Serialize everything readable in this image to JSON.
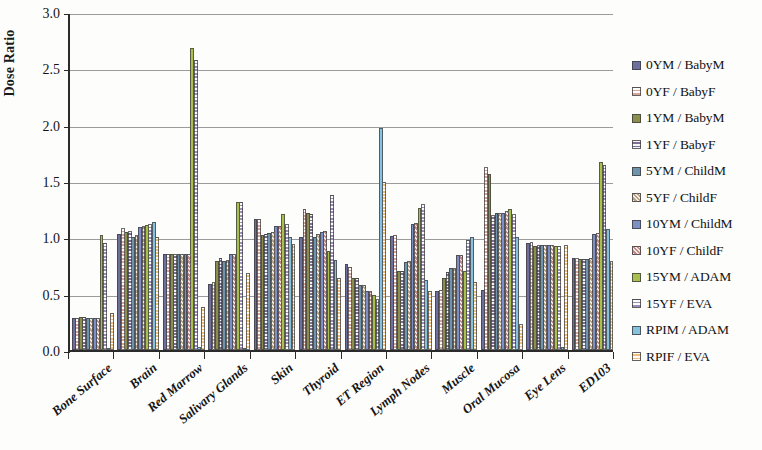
{
  "chart_data": {
    "type": "bar",
    "title": "",
    "xlabel": "",
    "ylabel": "Dose Ratio",
    "ylim": [
      0,
      3.0
    ],
    "ytick_labels": [
      "0.0",
      "0.5",
      "1.0",
      "1.5",
      "2.0",
      "2.5",
      "3.0"
    ],
    "ytick_values": [
      0,
      0.5,
      1.0,
      1.5,
      2.0,
      2.5,
      3.0
    ],
    "grid": true,
    "legend_position": "right",
    "categories": [
      "Bone Surface",
      "Brain",
      "Red Marrow",
      "Salivary Glands",
      "Skin",
      "Thyroid",
      "ET Region",
      "Lymph Nodes",
      "Muscle",
      "Oral Mucosa",
      "Eye Lens",
      "ED103"
    ],
    "series": [
      {
        "name": "0YM / BabyM",
        "color": "#6d6f9e",
        "pattern": "solid",
        "values": [
          0.28,
          1.03,
          0.85,
          0.59,
          1.16,
          1.0,
          0.76,
          1.01,
          0.52,
          0.53,
          0.95,
          0.82
        ]
      },
      {
        "name": "0YF / BabyF",
        "color": "#d7a49a",
        "pattern": "open",
        "values": [
          0.28,
          1.08,
          0.85,
          0.6,
          1.16,
          1.25,
          0.74,
          1.02,
          0.53,
          1.62,
          0.96,
          0.82
        ]
      },
      {
        "name": "1YM / BabyM",
        "color": "#8a8f4e",
        "pattern": "solid",
        "values": [
          0.29,
          1.05,
          0.85,
          0.79,
          1.02,
          1.22,
          0.64,
          0.7,
          0.64,
          1.56,
          0.92,
          0.81
        ]
      },
      {
        "name": "1YF / BabyF",
        "color": "#7c6e96",
        "pattern": "dots",
        "values": [
          0.29,
          1.06,
          0.85,
          0.82,
          1.03,
          1.21,
          0.64,
          0.7,
          0.69,
          1.2,
          0.93,
          0.81
        ]
      },
      {
        "name": "5YM / ChildM",
        "color": "#6f95ad",
        "pattern": "solid",
        "values": [
          0.28,
          1.0,
          0.85,
          0.79,
          1.04,
          1.0,
          0.58,
          0.78,
          0.73,
          1.22,
          0.93,
          0.81
        ]
      },
      {
        "name": "5YF / ChildF",
        "color": "#b8a183",
        "pattern": "diag",
        "values": [
          0.28,
          1.02,
          0.85,
          0.8,
          1.05,
          1.03,
          0.58,
          0.79,
          0.73,
          1.22,
          0.93,
          0.82
        ]
      },
      {
        "name": "10YM / ChildM",
        "color": "#7d8fc4",
        "pattern": "solid",
        "values": [
          0.28,
          1.09,
          0.85,
          0.85,
          1.1,
          1.05,
          0.52,
          1.12,
          0.84,
          1.22,
          0.93,
          1.03
        ]
      },
      {
        "name": "10YF / ChildF",
        "color": "#c08b87",
        "pattern": "diag",
        "values": [
          0.28,
          1.1,
          0.85,
          0.85,
          1.1,
          1.06,
          0.52,
          1.13,
          0.84,
          1.23,
          0.93,
          1.04
        ]
      },
      {
        "name": "15YM / ADAM",
        "color": "#a9c04f",
        "pattern": "solid",
        "values": [
          1.02,
          1.11,
          2.68,
          1.31,
          1.21,
          0.88,
          0.49,
          1.26,
          0.7,
          1.25,
          0.92,
          1.67
        ]
      },
      {
        "name": "15YF / EVA",
        "color": "#9d8dbd",
        "pattern": "open",
        "values": [
          0.95,
          1.12,
          2.57,
          1.31,
          1.12,
          1.38,
          0.45,
          1.3,
          0.98,
          1.21,
          0.92,
          1.64
        ]
      },
      {
        "name": "RPIM / ADAM",
        "color": "#86c1dd",
        "pattern": "solid",
        "values": [
          0.02,
          1.14,
          0.03,
          0.02,
          1.0,
          0.8,
          1.97,
          0.62,
          1.0,
          1.0,
          0.03,
          1.07
        ]
      },
      {
        "name": "RPIF / EVA",
        "color": "#f0c07a",
        "pattern": "dots",
        "values": [
          0.33,
          1.0,
          0.38,
          0.68,
          0.94,
          0.64,
          1.49,
          0.52,
          0.6,
          0.23,
          0.93,
          0.79
        ]
      }
    ]
  },
  "axes": {
    "y_title": "Dose Ratio"
  },
  "legend": {
    "items": [
      {
        "label": "0YM / BabyM"
      },
      {
        "label": "0YF / BabyF"
      },
      {
        "label": "1YM / BabyM"
      },
      {
        "label": "1YF / BabyF"
      },
      {
        "label": "5YM / ChildM"
      },
      {
        "label": "5YF / ChildF"
      },
      {
        "label": "10YM / ChildM"
      },
      {
        "label": "10YF / ChildF"
      },
      {
        "label": "15YM / ADAM"
      },
      {
        "label": "15YF / EVA"
      },
      {
        "label": "RPIM / ADAM"
      },
      {
        "label": "RPIF / EVA"
      }
    ]
  }
}
